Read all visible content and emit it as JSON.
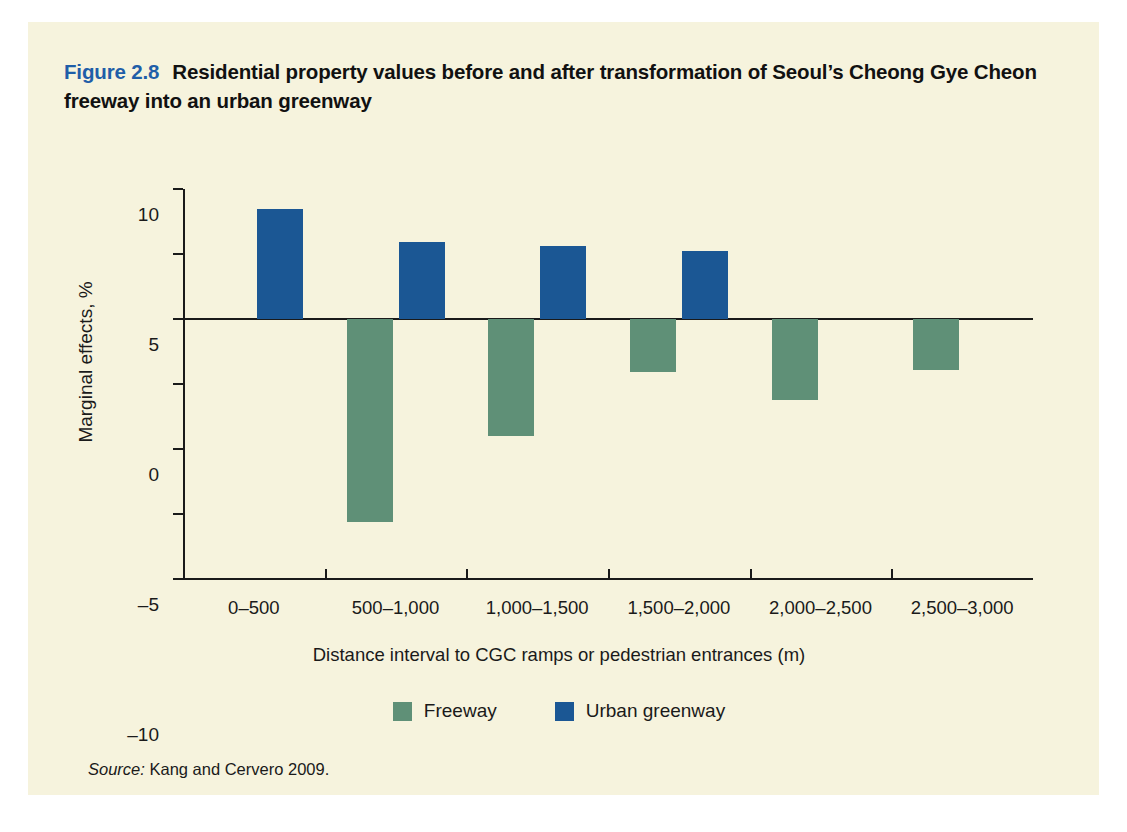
{
  "figure": {
    "number": "Figure 2.8",
    "title": "Residential property values before and after transformation of Seoul’s Cheong Gye Cheon freeway into an urban greenway",
    "source_label": "Source:",
    "source_text": "Kang and Cervero 2009."
  },
  "colors": {
    "background": "#f6f3dd",
    "page": "#ffffff",
    "freeway": "#5f9077",
    "urban_greenway": "#1b5794",
    "axis": "#1a1a1a",
    "figure_number": "#1f5ea8"
  },
  "chart_data": {
    "type": "bar",
    "title": "Residential property values before and after transformation of Seoul’s Cheong Gye Cheon freeway into an urban greenway",
    "xlabel": "Distance interval to CGC ramps or pedestrian entrances (m)",
    "ylabel": "Marginal effects, %",
    "categories": [
      "0–500",
      "500–1,000",
      "1,000–1,500",
      "1,500–2,000",
      "2,000–2,500",
      "2,500–3,000"
    ],
    "series": [
      {
        "name": "Freeway",
        "color": "#5f9077",
        "values": [
          null,
          -15.6,
          -9.0,
          -4.1,
          -6.2,
          -3.9
        ]
      },
      {
        "name": "Urban greenway",
        "color": "#1b5794",
        "values": [
          8.5,
          5.9,
          5.6,
          5.2,
          null,
          null
        ]
      }
    ],
    "ylim": [
      -20,
      10
    ],
    "ytick_values": [
      10,
      5,
      0,
      -5,
      -10,
      -15,
      -20
    ],
    "ytick_labels": [
      "10",
      "5",
      "0",
      "–5",
      "–10",
      "–15",
      "–20"
    ],
    "grid": false,
    "legend_position": "bottom"
  }
}
